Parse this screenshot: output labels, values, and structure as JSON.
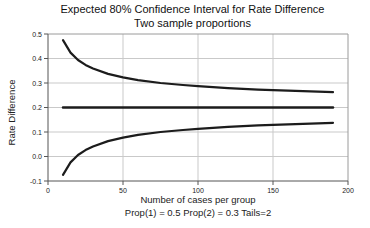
{
  "chart_data": {
    "type": "line",
    "title": "Expected 80% Confidence Interval for Rate Difference",
    "subtitle": "Two sample proportions",
    "xlabel": "Number of cases per group",
    "xlabel2": "Prop(1) = 0.5 Prop(2) = 0.3 Tails=2",
    "ylabel": "Rate Difference",
    "xlim": [
      0,
      200
    ],
    "ylim": [
      -0.1,
      0.5
    ],
    "xticks": [
      0,
      50,
      100,
      150,
      200
    ],
    "yticks": [
      -0.1,
      0.0,
      0.1,
      0.2,
      0.3,
      0.4,
      0.5
    ],
    "grid": true,
    "legend": "none",
    "x": [
      10,
      15,
      20,
      25,
      30,
      40,
      50,
      60,
      75,
      90,
      100,
      120,
      140,
      150,
      160,
      175,
      190
    ],
    "series": [
      {
        "name": "Upper 80% CI bound",
        "values": [
          0.475,
          0.424,
          0.394,
          0.374,
          0.359,
          0.337,
          0.323,
          0.312,
          0.3,
          0.292,
          0.287,
          0.279,
          0.273,
          0.271,
          0.269,
          0.266,
          0.263
        ]
      },
      {
        "name": "Expected rate difference",
        "values": [
          0.2,
          0.2,
          0.2,
          0.2,
          0.2,
          0.2,
          0.2,
          0.2,
          0.2,
          0.2,
          0.2,
          0.2,
          0.2,
          0.2,
          0.2,
          0.2,
          0.2
        ]
      },
      {
        "name": "Lower 80% CI bound",
        "values": [
          -0.075,
          -0.024,
          0.006,
          0.026,
          0.041,
          0.063,
          0.077,
          0.088,
          0.1,
          0.108,
          0.113,
          0.121,
          0.127,
          0.129,
          0.131,
          0.134,
          0.137
        ]
      }
    ],
    "colors": {
      "background": "#ffffff",
      "line": "#1c1c1c",
      "grid": "#c9c9c9",
      "frame": "#9a9a9a",
      "axis": "#555555",
      "tick_text": "#222222"
    }
  }
}
